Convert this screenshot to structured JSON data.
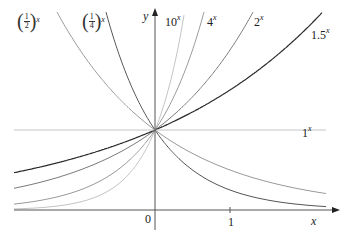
{
  "diagram": {
    "axes": {
      "x_label": "x",
      "y_label": "y",
      "origin_label": "0",
      "x_tick_label": "1"
    },
    "curves": [
      {
        "name": "half",
        "base": 0.5,
        "label_num": "1",
        "label_den": "2",
        "label_exp": "x",
        "color": "#9a9a9a"
      },
      {
        "name": "quarter",
        "base": 0.25,
        "label_num": "1",
        "label_den": "4",
        "label_exp": "x",
        "color": "#555555"
      },
      {
        "name": "ten",
        "base": 10,
        "label": "10",
        "label_exp": "x",
        "color": "#c4c4c4"
      },
      {
        "name": "four",
        "base": 4,
        "label": "4",
        "label_exp": "x",
        "color": "#9a9a9a"
      },
      {
        "name": "two",
        "base": 2,
        "label": "2",
        "label_exp": "x",
        "color": "#7a7a7a"
      },
      {
        "name": "one-point-five",
        "base": 1.5,
        "label": "1.5",
        "label_exp": "x",
        "color": "#2a2a2a"
      },
      {
        "name": "one",
        "base": 1,
        "label": "1",
        "label_exp": "x",
        "color": "#c4c4c4"
      }
    ],
    "colors": {
      "axis": "#555555",
      "background": "#ffffff"
    }
  }
}
